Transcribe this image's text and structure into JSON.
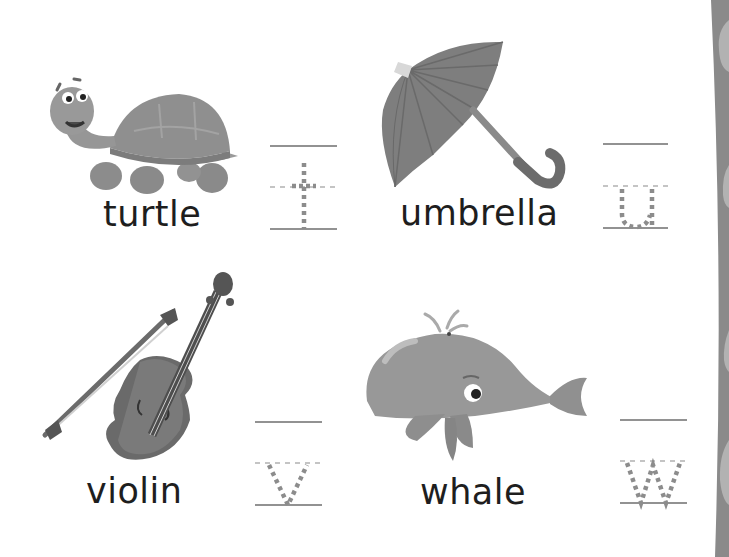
{
  "worksheet": {
    "items": [
      {
        "word": "turtle",
        "letter": "t",
        "picture": "turtle-picture"
      },
      {
        "word": "umbrella",
        "letter": "u",
        "picture": "umbrella-picture"
      },
      {
        "word": "violin",
        "letter": "v",
        "picture": "violin-picture"
      },
      {
        "word": "whale",
        "letter": "w",
        "picture": "whale-picture"
      }
    ]
  },
  "colors": {
    "text": "#1e1e1e",
    "guide_line": "#6e6e6e",
    "trace_dots": "#8c8c8c",
    "side_strip": "#8a8a8a",
    "side_blob": "#b4b4b4"
  }
}
